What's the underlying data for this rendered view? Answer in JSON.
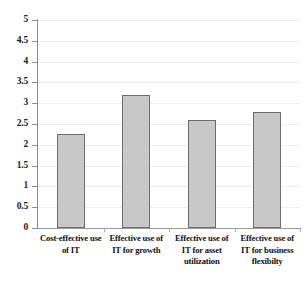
{
  "chart_data": {
    "type": "bar",
    "title": "",
    "xlabel": "",
    "ylabel": "",
    "categories": [
      "Cost-effective use of IT",
      "Effective use of IT for growth",
      "Effective use of IT for asset utilization",
      "Effective use of IT for business flexibilty"
    ],
    "values": [
      2.25,
      3.2,
      2.6,
      2.8
    ],
    "ylim": [
      0,
      5
    ],
    "ytick_step": 0.5,
    "ytick_labels": [
      "5",
      "4.5",
      "4",
      "3.5",
      "3",
      "2.5",
      "2",
      "1.5",
      "1",
      "0.5",
      "0"
    ],
    "ytick_values": [
      5,
      4.5,
      4,
      3.5,
      3,
      2.5,
      2,
      1.5,
      1,
      0.5,
      0
    ],
    "grid": true,
    "legend": false,
    "series": [
      {
        "name": "",
        "values": [
          2.25,
          3.2,
          2.6,
          2.8
        ]
      }
    ],
    "colors": {
      "bar_fill": "#c8c8c8",
      "bar_border": "#6e6e6e",
      "gridline": "#ececec",
      "axis": "#8c8c8c",
      "text": "#111111",
      "background": "#ffffff"
    }
  }
}
